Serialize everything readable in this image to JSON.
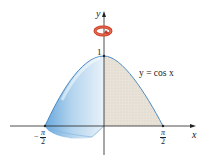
{
  "figure": {
    "function_label": "y = cos x",
    "axes": {
      "x_label": "x",
      "y_label": "y",
      "y_tick_label": "1",
      "x_ticks": [
        {
          "sign": "−",
          "numerator": "π",
          "denominator": "2"
        },
        {
          "sign": "",
          "numerator": "π",
          "denominator": "2"
        }
      ]
    },
    "rotation_indicator": "rotation about y-axis",
    "colors": {
      "solid_fill": "#9fc8ea",
      "solid_edge": "#3a7fc0",
      "region_fill": "#e6e0d6",
      "rotation_arrow": "#d8492e",
      "axis": "#222222"
    }
  }
}
